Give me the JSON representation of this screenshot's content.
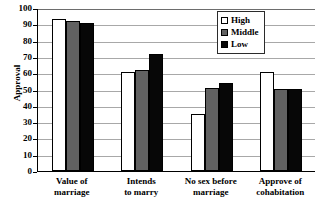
{
  "chart_data": {
    "type": "bar",
    "title": "",
    "xlabel": "",
    "ylabel": "Approval",
    "ylim": [
      0,
      100
    ],
    "yticks": [
      0,
      10,
      20,
      30,
      40,
      50,
      60,
      70,
      80,
      90,
      100
    ],
    "grid": true,
    "legend_position": "top-right",
    "categories": [
      "Value of marriage",
      "Intends to marry",
      "No sex before marriage",
      "Approve of cohabitation"
    ],
    "category_lines": [
      [
        "Value of",
        "marriage"
      ],
      [
        "Intends",
        "to marry"
      ],
      [
        "No sex before",
        "marriage"
      ],
      [
        "Approve of",
        "cohabitation"
      ]
    ],
    "series": [
      {
        "name": "High",
        "color": "#ffffff",
        "values": [
          93,
          61,
          35,
          61
        ]
      },
      {
        "name": "Middle",
        "color": "#616161",
        "values": [
          92,
          62,
          51,
          50
        ]
      },
      {
        "name": "Low",
        "color": "#070707",
        "values": [
          91,
          72,
          54,
          50
        ]
      }
    ]
  },
  "legend": {
    "items": [
      {
        "label": "High",
        "swatch": "white-square-icon"
      },
      {
        "label": "Middle",
        "swatch": "gray-square-icon"
      },
      {
        "label": "Low",
        "swatch": "black-square-icon"
      }
    ]
  }
}
